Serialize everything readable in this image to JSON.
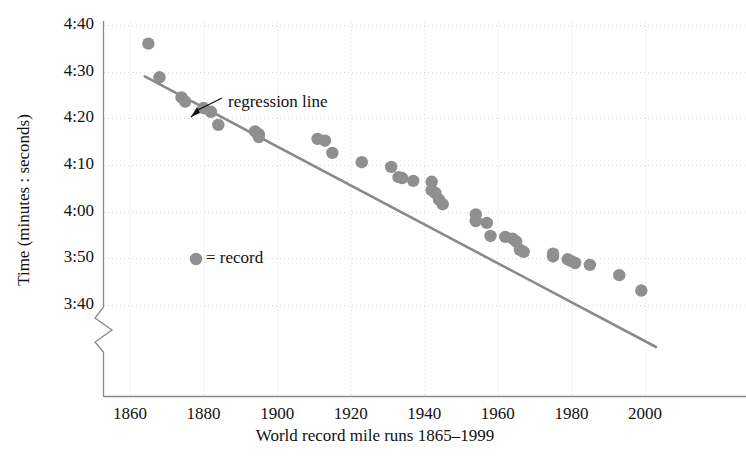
{
  "chart_data": {
    "type": "scatter",
    "title": "",
    "xlabel": "World record mile runs 1865–1999",
    "ylabel": "Time (minutes : seconds)",
    "xlim": [
      1855,
      2005
    ],
    "ylim_seconds": [
      220,
      280
    ],
    "grid": true,
    "y_axis_break": true,
    "legend": {
      "position": "inside-left",
      "marker": "●",
      "equals": "=",
      "label": "record",
      "text": "● = record"
    },
    "annotations": [
      {
        "text": "regression line",
        "points_to": "trend-line",
        "arrow": true
      }
    ],
    "xticks": [
      1860,
      1880,
      1900,
      1920,
      1940,
      1960,
      1980,
      2000
    ],
    "xticklabels": [
      "1860",
      "1880",
      "1900",
      "1920",
      "1940",
      "1960",
      "1980",
      "2000"
    ],
    "yticks_seconds": [
      280,
      270,
      260,
      250,
      240,
      230,
      220
    ],
    "yticklabels": [
      "4:40",
      "4:30",
      "4:20",
      "4:10",
      "4:00",
      "3:50",
      "3:40"
    ],
    "series": [
      {
        "name": "record",
        "marker": "circle",
        "color": "#8f8f8f",
        "x": [
          1865,
          1868,
          1874,
          1875,
          1880,
          1882,
          1884,
          1894,
          1895,
          1895,
          1911,
          1913,
          1915,
          1923,
          1931,
          1933,
          1934,
          1937,
          1942,
          1942,
          1943,
          1944,
          1945,
          1954,
          1954,
          1957,
          1958,
          1962,
          1964,
          1965,
          1966,
          1967,
          1975,
          1975,
          1979,
          1980,
          1981,
          1985,
          1993,
          1999
        ],
        "y_seconds": [
          276.0,
          268.8,
          264.5,
          263.6,
          262.2,
          261.4,
          258.6,
          257.2,
          256.6,
          256.0,
          255.6,
          255.2,
          252.6,
          250.6,
          249.6,
          247.4,
          247.2,
          246.6,
          246.4,
          244.6,
          244.0,
          242.6,
          241.6,
          239.4,
          238.0,
          237.6,
          234.8,
          234.6,
          234.2,
          233.6,
          231.8,
          231.4,
          231.0,
          230.4,
          229.8,
          229.4,
          229.0,
          228.6,
          226.4,
          223.1
        ],
        "y_labels": [
          "4:36",
          "4:28.8",
          "4:24.5",
          "4:23.6",
          "4:22.2",
          "4:21.4",
          "4:18.6",
          "4:17.2",
          "4:16.6",
          "4:16.0",
          "4:15.6",
          "4:15.2",
          "4:12.6",
          "4:10.6",
          "4:09.6",
          "4:07.4",
          "4:07.2",
          "4:06.6",
          "4:06.4",
          "4:04.6",
          "4:04.0",
          "4:02.6",
          "4:01.6",
          "3:59.4",
          "3:58.0",
          "3:57.6",
          "3:54.8",
          "3:54.6",
          "3:54.2",
          "3:53.6",
          "3:51.8",
          "3:51.4",
          "3:51.0",
          "3:50.4",
          "3:49.8",
          "3:49.4",
          "3:49.0",
          "3:48.6",
          "3:46.4",
          "3:43.1"
        ]
      }
    ],
    "trend_line": {
      "name": "regression line",
      "color": "#8a8a8a",
      "x_start": 1864,
      "x_end": 2003,
      "y_start_seconds": 269.0,
      "y_end_seconds": 211.0
    }
  },
  "colors": {
    "marker": "#8f8f8f",
    "line": "#8a8a8a",
    "axis": "#8a8a8a",
    "grid": "#d8d8dd",
    "text": "#111111",
    "background": "#ffffff"
  }
}
